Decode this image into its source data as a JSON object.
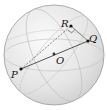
{
  "diagram": {
    "sphere": {
      "cx": 54,
      "cy": 55,
      "r": 50,
      "fill": "#e9e9e9",
      "stroke": "#9a9a9a"
    },
    "points": {
      "P": {
        "label": "P",
        "x": 21,
        "y": 69
      },
      "Q": {
        "label": "Q",
        "x": 88,
        "y": 41
      },
      "R": {
        "label": "R",
        "x": 71,
        "y": 26
      },
      "O": {
        "label": "O",
        "x": 54,
        "y": 54
      }
    },
    "segments": [
      {
        "from": "P",
        "to": "Q",
        "style": "solid"
      },
      {
        "from": "P",
        "to": "R",
        "style": "dashed"
      },
      {
        "from": "R",
        "to": "Q",
        "style": "solid"
      }
    ],
    "right_angle_at": "R"
  }
}
